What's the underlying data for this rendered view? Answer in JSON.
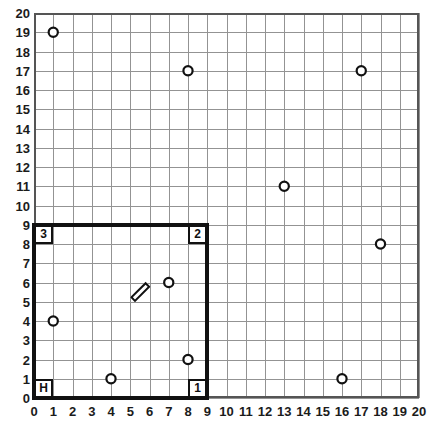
{
  "chart_data": {
    "type": "scatter",
    "title": "",
    "xlabel": "",
    "ylabel": "",
    "xlim": [
      0,
      20
    ],
    "ylim": [
      0,
      20
    ],
    "grid": true,
    "grid_step": 1,
    "y_axis_direction": "up",
    "legend": "none",
    "xticklabels": [
      "0",
      "1",
      "2",
      "3",
      "4",
      "5",
      "6",
      "7",
      "8",
      "9",
      "10",
      "11",
      "12",
      "13",
      "14",
      "15",
      "16",
      "17",
      "18",
      "19",
      "20"
    ],
    "yticklabels": [
      "0",
      "1",
      "2",
      "3",
      "4",
      "5",
      "6",
      "7",
      "8",
      "9",
      "10",
      "11",
      "12",
      "13",
      "14",
      "15",
      "16",
      "17",
      "18",
      "19",
      "20"
    ],
    "series": [
      {
        "name": "obstacles",
        "marker": "open-circle",
        "points": [
          {
            "x": 1,
            "y": 19
          },
          {
            "x": 8,
            "y": 17
          },
          {
            "x": 17,
            "y": 17
          },
          {
            "x": 13,
            "y": 11
          },
          {
            "x": 18,
            "y": 8
          },
          {
            "x": 7,
            "y": 6
          },
          {
            "x": 1,
            "y": 4
          },
          {
            "x": 8,
            "y": 2
          },
          {
            "x": 4,
            "y": 1
          },
          {
            "x": 16,
            "y": 1
          }
        ]
      }
    ],
    "regions": [
      {
        "name": "boundary-rectangle",
        "x0": 0,
        "y0": 0,
        "x1": 9,
        "y1": 9,
        "stroke": "#111111",
        "fill": "none"
      }
    ],
    "corner_markers": [
      {
        "label": "3",
        "x": 0,
        "y": 8
      },
      {
        "label": "2",
        "x": 8,
        "y": 8
      },
      {
        "label": "H",
        "x": 0,
        "y": 0
      },
      {
        "label": "1",
        "x": 8,
        "y": 0
      }
    ],
    "agent": {
      "name": "robot-rod",
      "x": 5.5,
      "y": 5.5,
      "angle_deg": 45,
      "length": 1.0,
      "width": 0.3
    },
    "colors": {
      "grid": "#939393",
      "frame": "#555555",
      "boundary": "#111111",
      "marker_stroke": "#111111",
      "marker_fill": "#ffffff",
      "text": "#1b1b1b",
      "background": "#ffffff"
    }
  }
}
